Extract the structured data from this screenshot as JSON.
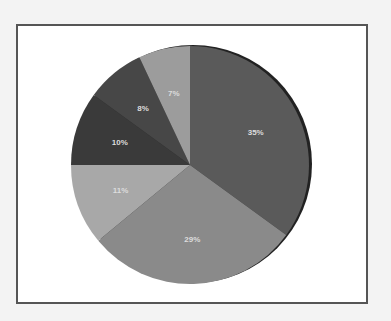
{
  "chart_data": {
    "type": "pie",
    "title": "",
    "slices": [
      {
        "label": "35%",
        "value": 35,
        "color": "#5a5a5a"
      },
      {
        "label": "29%",
        "value": 29,
        "color": "#8a8a8a"
      },
      {
        "label": "11%",
        "value": 11,
        "color": "#a8a8a8"
      },
      {
        "label": "10%",
        "value": 10,
        "color": "#3a3a3a"
      },
      {
        "label": "8%",
        "value": 8,
        "color": "#474747"
      },
      {
        "label": "7%",
        "value": 7,
        "color": "#9c9c9c"
      }
    ],
    "values": [
      35,
      29,
      11,
      10,
      8,
      7
    ],
    "categories": [
      "35%",
      "29%",
      "11%",
      "10%",
      "8%",
      "7%"
    ],
    "legend": "none",
    "start_angle": "12 o'clock, clockwise"
  }
}
